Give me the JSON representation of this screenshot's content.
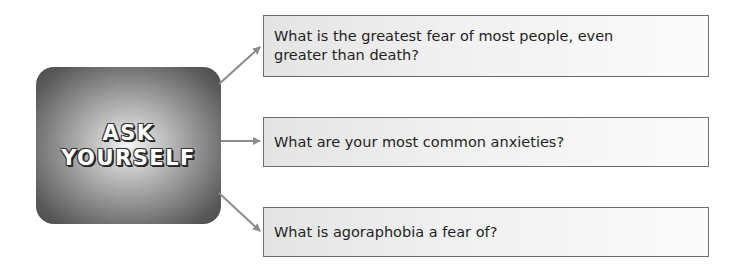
{
  "hub": {
    "line1": "ASK",
    "line2": "YOURSELF"
  },
  "questions": [
    {
      "text": "What is the greatest fear of most people, even greater than death?"
    },
    {
      "text": "What are your most common anxieties?"
    },
    {
      "text": "What is agoraphobia a fear of?"
    }
  ],
  "colors": {
    "arrow": "#8c8c8c",
    "box_border": "#6e6e6e",
    "hub_dark": "#4a4a4a",
    "hub_light": "#f4f4f4"
  }
}
